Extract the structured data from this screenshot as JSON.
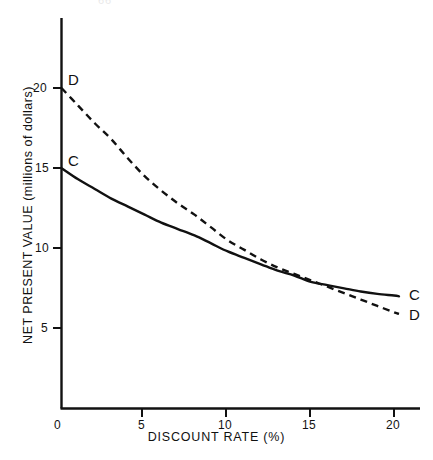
{
  "figure": {
    "page_artifact": "66",
    "background_color": "#ffffff",
    "ink_color": "#111111"
  },
  "chart_data": {
    "type": "line",
    "title": "",
    "xlabel": "DISCOUNT RATE (%)",
    "ylabel": "NET PRESENT VALUE (millions of dollars)",
    "xlim": [
      0,
      21.5
    ],
    "ylim": [
      0,
      23.5
    ],
    "xticks": [
      0,
      5,
      10,
      15,
      20
    ],
    "xticklabels": [
      "0",
      "5",
      "10",
      "15",
      "20"
    ],
    "yticks": [
      5,
      10,
      15,
      20
    ],
    "yticklabels": [
      "5",
      "10",
      "15",
      "20"
    ],
    "grid": false,
    "legend": "inline-end-labels",
    "x": [
      0,
      1,
      2,
      3,
      4,
      5,
      6,
      7,
      8,
      9,
      10,
      11,
      12,
      13,
      14,
      15,
      16,
      17,
      18,
      19,
      20,
      20.3
    ],
    "series": [
      {
        "name": "C",
        "label": "C",
        "linestyle": "solid",
        "values": [
          15.0,
          14.3,
          13.7,
          13.1,
          12.6,
          12.1,
          11.6,
          11.2,
          10.8,
          10.3,
          9.8,
          9.4,
          9.0,
          8.6,
          8.3,
          7.9,
          7.7,
          7.5,
          7.3,
          7.15,
          7.05,
          7.0
        ],
        "label_position": {
          "x": 20.3,
          "y": 7.0
        }
      },
      {
        "name": "D",
        "label": "D",
        "linestyle": "dashed",
        "values": [
          20.0,
          18.9,
          17.8,
          16.8,
          15.6,
          14.5,
          13.6,
          12.8,
          12.1,
          11.3,
          10.5,
          9.9,
          9.3,
          8.8,
          8.4,
          8.0,
          7.6,
          7.2,
          6.8,
          6.4,
          6.0,
          5.9
        ],
        "label_position": {
          "x": 20.3,
          "y": 5.9
        }
      }
    ],
    "annotations": [
      {
        "name": "curve-c-start-label",
        "text": "C",
        "x": 0,
        "y": 15.0
      },
      {
        "name": "curve-d-start-label",
        "text": "D",
        "x": 0,
        "y": 20.0
      },
      {
        "name": "curve-c-end-label",
        "text": "C",
        "x": 20.3,
        "y": 7.0
      },
      {
        "name": "curve-d-end-label",
        "text": "D",
        "x": 20.3,
        "y": 5.9
      }
    ],
    "crossover": {
      "x": 15.0,
      "y": 7.9
    }
  }
}
